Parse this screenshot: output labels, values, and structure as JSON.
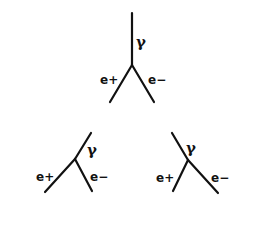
{
  "diagram": {
    "type": "electromagnetic-cascade",
    "colors": {
      "line": "#111111",
      "burst": "#8a8a8a",
      "background": "#ffffff"
    },
    "labels": {
      "gamma": "γ",
      "positron": "e+",
      "electron": "e−"
    },
    "generation1": {
      "photon": {
        "label": "γ"
      },
      "positron": {
        "label": "e+"
      },
      "electron": {
        "label": "e−"
      }
    },
    "generation2_left": {
      "photon": {
        "label": "γ"
      },
      "positron": {
        "label": "e+"
      },
      "electron": {
        "label": "e−"
      }
    },
    "generation2_right": {
      "photon": {
        "label": "γ"
      },
      "positron": {
        "label": "e+"
      },
      "electron": {
        "label": "e−"
      }
    },
    "bursts": [
      {
        "id": "burst-1",
        "x": 101,
        "y": 115
      },
      {
        "id": "burst-2",
        "x": 163,
        "y": 115
      },
      {
        "id": "burst-3",
        "x": 32,
        "y": 206
      },
      {
        "id": "burst-4",
        "x": 98,
        "y": 206
      },
      {
        "id": "burst-5",
        "x": 163,
        "y": 206
      },
      {
        "id": "burst-6",
        "x": 228,
        "y": 206
      }
    ]
  }
}
